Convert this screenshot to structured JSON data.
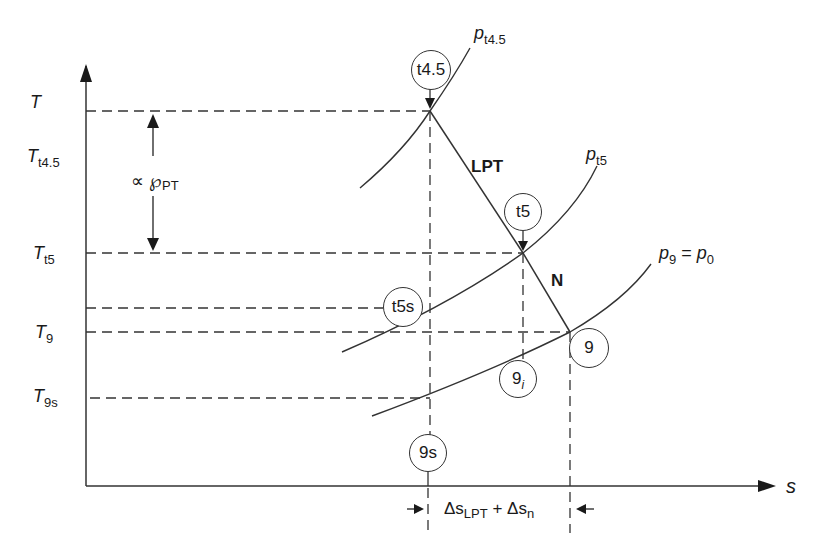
{
  "diagram": {
    "type": "T-s diagram (temperature-entropy) for LPT and nozzle expansion",
    "axes": {
      "y_label": "T",
      "x_label": "s"
    },
    "y_levels": [
      {
        "id": "T",
        "base": "T",
        "sub": ""
      },
      {
        "id": "Tt45",
        "base": "T",
        "sub": "t4.5"
      },
      {
        "id": "Tt5",
        "base": "T",
        "sub": "t5"
      },
      {
        "id": "T9",
        "base": "T",
        "sub": "9"
      },
      {
        "id": "T9s",
        "base": "T",
        "sub": "9s"
      }
    ],
    "isobars": [
      {
        "id": "pt45",
        "base": "p",
        "sub": "t4.5"
      },
      {
        "id": "pt5",
        "base": "p",
        "sub": "t5"
      },
      {
        "id": "p9",
        "base": "p",
        "sub": "9",
        "equals": "= ",
        "rhs_base": "p",
        "rhs_sub": "0"
      }
    ],
    "state_points": [
      {
        "id": "t4.5",
        "label": "t4.5",
        "sub": ""
      },
      {
        "id": "t5",
        "label": "t5",
        "sub": ""
      },
      {
        "id": "t5s",
        "label": "t5s",
        "sub": ""
      },
      {
        "id": "9",
        "label": "9",
        "sub": ""
      },
      {
        "id": "9i",
        "label": "9",
        "sub": "i"
      },
      {
        "id": "9s",
        "label": "9s",
        "sub": ""
      }
    ],
    "process_labels": {
      "lpt": "LPT",
      "nozzle": "N"
    },
    "power_annotation": {
      "prefix": "∝ ℘",
      "sub": "PT"
    },
    "entropy_annotation": {
      "delta1": "Δs",
      "sub1": "LPT",
      "plus": " + Δs",
      "sub2": "n"
    },
    "colors": {
      "line": "#333333",
      "background": "#ffffff"
    }
  }
}
